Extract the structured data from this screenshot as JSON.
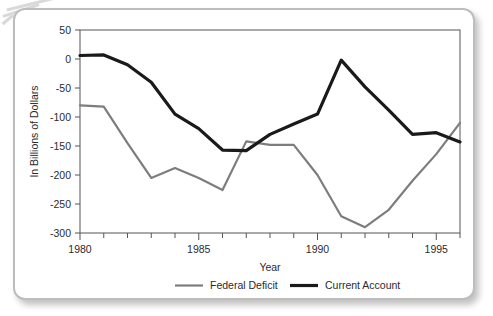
{
  "figure": {
    "frame_color": "#bdbdbd",
    "background": "#ffffff"
  },
  "chart_data": {
    "type": "line",
    "title": "",
    "xlabel": "Year",
    "ylabel": "In Billions of Dollars",
    "xlim": [
      1980,
      1996
    ],
    "ylim": [
      -300,
      50
    ],
    "xticks": [
      1980,
      1985,
      1990,
      1995
    ],
    "xtick_labels": [
      "1980",
      "1985",
      "1990",
      "1995"
    ],
    "xminor_step": 1,
    "yticks": [
      50,
      0,
      -50,
      -100,
      -150,
      -200,
      -250,
      -300
    ],
    "ytick_labels": [
      "50",
      "0",
      "-50",
      "-100",
      "-150",
      "-200",
      "-250",
      "-300"
    ],
    "grid": false,
    "legend_position": "bottom",
    "x": [
      1980,
      1981,
      1982,
      1983,
      1984,
      1985,
      1986,
      1987,
      1988,
      1989,
      1990,
      1991,
      1992,
      1993,
      1994,
      1995,
      1996
    ],
    "series": [
      {
        "name": "Federal Deficit",
        "color": "#7d7d7d",
        "width": 2.2,
        "values": [
          -80,
          -82,
          -145,
          -205,
          -188,
          -205,
          -226,
          -142,
          -148,
          -148,
          -200,
          -271,
          -290,
          -260,
          -210,
          -164,
          -110
        ]
      },
      {
        "name": "Current Account",
        "color": "#1a1a1a",
        "width": 3.2,
        "values": [
          6,
          7,
          -10,
          -40,
          -95,
          -120,
          -157,
          -158,
          -130,
          -112,
          -95,
          -2,
          -48,
          -88,
          -130,
          -127,
          -143
        ]
      }
    ]
  },
  "axes": {
    "y_title": "In Billions of Dollars",
    "x_title": "Year"
  },
  "legend": {
    "items": [
      {
        "label": "Federal Deficit",
        "color": "#7d7d7d",
        "width": 2.2
      },
      {
        "label": "Current Account",
        "color": "#1a1a1a",
        "width": 3.2
      }
    ]
  }
}
